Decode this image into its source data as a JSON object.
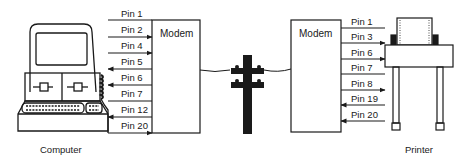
{
  "diagram": {
    "type": "serial-connection",
    "left_device": {
      "label": "Computer"
    },
    "right_device": {
      "label": "Printer"
    },
    "left_modem": {
      "label": "Modem",
      "pins": [
        {
          "label": "Pin 1",
          "direction": "none"
        },
        {
          "label": "Pin 2",
          "direction": "to-modem"
        },
        {
          "label": "Pin 4",
          "direction": "to-modem"
        },
        {
          "label": "Pin 5",
          "direction": "to-computer"
        },
        {
          "label": "Pin 6",
          "direction": "to-computer"
        },
        {
          "label": "Pin 7",
          "direction": "none"
        },
        {
          "label": "Pin 12",
          "direction": "to-computer"
        },
        {
          "label": "Pin 20",
          "direction": "to-modem"
        }
      ]
    },
    "right_modem": {
      "label": "Modem",
      "pins": [
        {
          "label": "Pin 1",
          "direction": "none"
        },
        {
          "label": "Pin 3",
          "direction": "to-printer"
        },
        {
          "label": "Pin 6",
          "direction": "to-printer"
        },
        {
          "label": "Pin 7",
          "direction": "none"
        },
        {
          "label": "Pin 8",
          "direction": "to-printer"
        },
        {
          "label": "Pin 19",
          "direction": "to-modem"
        },
        {
          "label": "Pin 20",
          "direction": "to-modem"
        }
      ]
    },
    "link": {
      "icon": "telephone-pole-icon"
    },
    "colors": {
      "ink": "#1a1a1a",
      "background": "#ffffff"
    }
  }
}
